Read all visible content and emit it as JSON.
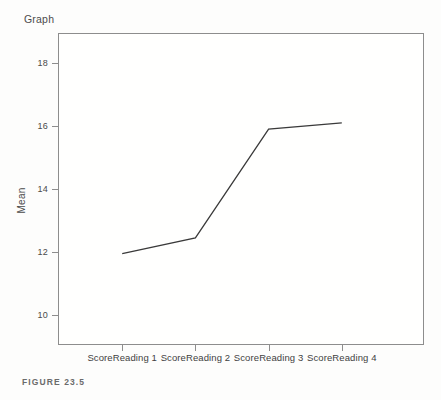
{
  "figure": {
    "caption": "FIGURE 23.5",
    "title": "Graph"
  },
  "chart_data": {
    "type": "line",
    "title": "Graph",
    "xlabel": "",
    "ylabel": "Mean",
    "categories": [
      "ScoreReading 1",
      "ScoreReading 2",
      "ScoreReading 3",
      "ScoreReading 4"
    ],
    "values": [
      11.95,
      12.45,
      15.9,
      16.1
    ],
    "series": [
      {
        "name": "Mean",
        "values": [
          11.95,
          12.45,
          15.9,
          16.1
        ]
      }
    ],
    "ylim": [
      9.05,
      18.95
    ],
    "yticks": [
      10,
      12,
      14,
      16,
      18
    ],
    "ytick_labels": [
      "10",
      "12",
      "14",
      "16",
      "18"
    ],
    "grid": false,
    "legend": false,
    "legend_position": "none",
    "line_color": "#3a3a3a",
    "frame_color": "#8d8d8d",
    "background_color": "#fdfdfc"
  }
}
